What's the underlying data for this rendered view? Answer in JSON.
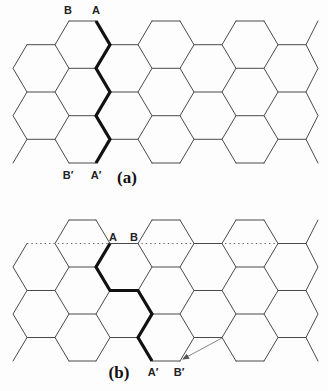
{
  "figure": {
    "style": {
      "line_color": "#4a4a4a",
      "thick_color": "#111111",
      "dotted_color": "#666666",
      "label_color": "#222222"
    },
    "lattice": {
      "x_levels": [
        13,
        27,
        55,
        69,
        96,
        110,
        138,
        152,
        180,
        194,
        222,
        236,
        264,
        278,
        306,
        318
      ],
      "zigzags": [
        [
          [
            1,
            1
          ],
          [
            0,
            2
          ],
          [
            1,
            3
          ],
          [
            0,
            4
          ],
          [
            1,
            5
          ],
          [
            0,
            6
          ]
        ],
        [
          [
            3,
            0
          ],
          [
            2,
            1
          ],
          [
            3,
            2
          ],
          [
            2,
            3
          ],
          [
            3,
            4
          ],
          [
            2,
            5
          ],
          [
            3,
            6
          ]
        ],
        [
          [
            4,
            0
          ],
          [
            5,
            1
          ],
          [
            4,
            2
          ],
          [
            5,
            3
          ],
          [
            4,
            4
          ],
          [
            5,
            5
          ],
          [
            4,
            6
          ]
        ],
        [
          [
            7,
            0
          ],
          [
            6,
            1
          ],
          [
            7,
            2
          ],
          [
            6,
            3
          ],
          [
            7,
            4
          ],
          [
            6,
            5
          ],
          [
            7,
            6
          ]
        ],
        [
          [
            8,
            0
          ],
          [
            9,
            1
          ],
          [
            8,
            2
          ],
          [
            9,
            3
          ],
          [
            8,
            4
          ],
          [
            9,
            5
          ],
          [
            8,
            6
          ]
        ],
        [
          [
            11,
            0
          ],
          [
            10,
            1
          ],
          [
            11,
            2
          ],
          [
            10,
            3
          ],
          [
            11,
            4
          ],
          [
            10,
            5
          ],
          [
            11,
            6
          ]
        ],
        [
          [
            12,
            0
          ],
          [
            13,
            1
          ],
          [
            12,
            2
          ],
          [
            13,
            3
          ],
          [
            12,
            4
          ],
          [
            13,
            5
          ],
          [
            12,
            6
          ]
        ],
        [
          [
            15,
            0
          ],
          [
            14,
            1
          ],
          [
            15,
            2
          ],
          [
            14,
            3
          ],
          [
            15,
            4
          ],
          [
            14,
            5
          ],
          [
            15,
            6
          ]
        ]
      ],
      "horizontals": [
        [
          1,
          2,
          [
            1,
            3,
            5
          ]
        ],
        [
          3,
          4,
          [
            0,
            2,
            4,
            6
          ]
        ],
        [
          5,
          6,
          [
            1,
            3,
            5
          ]
        ],
        [
          7,
          8,
          [
            0,
            2,
            4,
            6
          ]
        ],
        [
          9,
          10,
          [
            1,
            3,
            5
          ]
        ],
        [
          11,
          12,
          [
            0,
            2,
            4,
            6
          ]
        ],
        [
          13,
          14,
          [
            1,
            3,
            5
          ]
        ]
      ]
    },
    "panels": [
      {
        "id": "a",
        "caption": "(a)",
        "y_levels": [
          21,
          44.7,
          68.3,
          92,
          115.7,
          139.3,
          163
        ],
        "labels": {
          "top_left": "B",
          "top_right": "A",
          "bottom_left": "B′",
          "bottom_right": "A′"
        },
        "cut_path": [
          [
            4,
            0
          ],
          [
            5,
            1
          ],
          [
            4,
            2
          ],
          [
            5,
            3
          ],
          [
            4,
            4
          ],
          [
            5,
            5
          ],
          [
            4,
            6
          ]
        ],
        "omit_horizontals": [],
        "dotted_line": null,
        "arrow": null
      },
      {
        "id": "b",
        "caption": "(b)",
        "y_levels": [
          220,
          243.5,
          267,
          290.5,
          314,
          337.5,
          361
        ],
        "labels": {
          "top_left": "A",
          "top_right": "B",
          "bottom_left": "A′",
          "bottom_right": "B′"
        },
        "cut_path": [
          [
            5,
            1
          ],
          [
            4,
            2
          ],
          [
            5,
            3
          ],
          [
            6,
            3
          ],
          [
            7,
            4
          ],
          [
            6,
            5
          ],
          [
            7,
            6
          ]
        ],
        "omit_horizontals": [
          [
            1,
            2,
            1
          ]
        ],
        "dotted_line": {
          "from_j": 1,
          "to_j": 14,
          "i": 1
        },
        "arrow": {
          "from": [
            222,
            338
          ],
          "to": [
            183,
            359
          ]
        }
      }
    ]
  }
}
